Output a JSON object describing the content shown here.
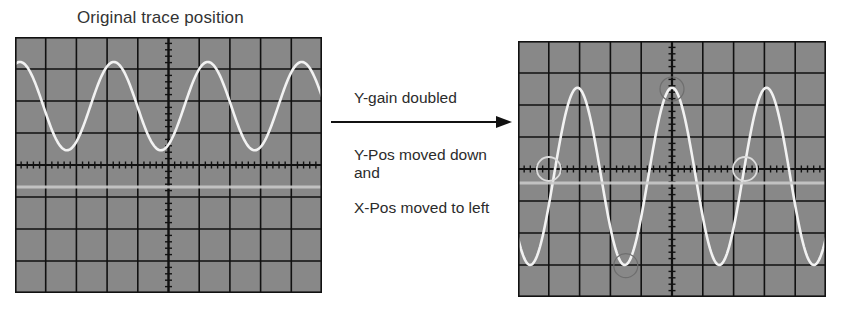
{
  "title": "Original trace position",
  "annotations": {
    "gain": "Y-gain doubled",
    "ypos": "Y-Pos moved down and",
    "xpos": "X-Pos moved to left"
  },
  "colors": {
    "screen": "#888888",
    "grid": "#111111",
    "trace": "#f2f2f2",
    "ground_line": "#c9c9c9",
    "marker_light": "#dcdcdc",
    "marker_dark": "#6e6e6e",
    "arrow": "#111111"
  },
  "grid": {
    "divisions_x": 10,
    "divisions_y": 8,
    "minor_ticks_per_division": 5
  },
  "chart_data": [
    {
      "type": "line",
      "title": "Original trace position",
      "xlabel": "",
      "ylabel": "",
      "xlim": [
        -5,
        5
      ],
      "ylim": [
        -4,
        4
      ],
      "grid": true,
      "series": [
        {
          "name": "trace",
          "kind": "sine",
          "amplitude_div": 1.38,
          "period_div": 3.06,
          "peak_at_x_div": -4.84,
          "offset_div": 1.84
        },
        {
          "name": "ground-reference",
          "kind": "hline",
          "y_div": -0.69
        }
      ],
      "markers": []
    },
    {
      "type": "line",
      "title": "",
      "xlabel": "",
      "ylabel": "",
      "xlim": [
        -5,
        5
      ],
      "ylim": [
        -4,
        4
      ],
      "grid": true,
      "series": [
        {
          "name": "trace",
          "kind": "sine",
          "amplitude_div": 2.77,
          "period_div": 3.07,
          "peak_at_x_div": 0.0,
          "offset_div": -0.23
        },
        {
          "name": "ground-reference",
          "kind": "hline",
          "y_div": -0.44
        }
      ],
      "markers": [
        {
          "name": "crossing-marker-left",
          "x_div": -4.0,
          "y_div": 0.0,
          "tone": "light"
        },
        {
          "name": "crossing-marker-right",
          "x_div": 2.37,
          "y_div": 0.0,
          "tone": "light"
        },
        {
          "name": "peak-marker",
          "x_div": 0.0,
          "y_div": 2.5,
          "tone": "dark"
        },
        {
          "name": "trough-marker",
          "x_div": -1.5,
          "y_div": -3.02,
          "tone": "dark"
        }
      ]
    }
  ]
}
